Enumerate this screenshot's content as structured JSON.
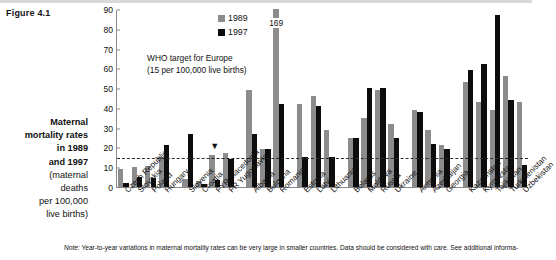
{
  "figure": {
    "label": "Figure 4.1"
  },
  "side_caption": {
    "lines": [
      {
        "text": "Maternal",
        "bold": true
      },
      {
        "text": "mortality rates",
        "bold": true
      },
      {
        "text": "in 1989",
        "bold": true
      },
      {
        "text": "and 1997",
        "bold": true
      },
      {
        "text": "(maternal",
        "bold": false
      },
      {
        "text": "deaths",
        "bold": false
      },
      {
        "text": "per 100,000",
        "bold": false
      },
      {
        "text": "live births)",
        "bold": false
      }
    ]
  },
  "legend": {
    "items": [
      {
        "label": "1989",
        "color": "#8c8c8c"
      },
      {
        "label": "1997",
        "color": "#0d0d0d"
      }
    ]
  },
  "annotations": {
    "who_target_line1": "WHO target for Europe",
    "who_target_line2": "(15 per 100,000 live births)",
    "who_target_value": 15,
    "romania_1989_label": "169",
    "caret_glyph": "▼"
  },
  "footnote": {
    "prefix": "Note:",
    "text": " Year-to-year variations in maternal mortality rates can be very large in smaller countries. Data should be considered with care. See additional informa-"
  },
  "chart_data": {
    "type": "bar",
    "xlabel": "",
    "ylabel": "maternal deaths per 100,000 live births",
    "ylim": [
      0,
      90
    ],
    "yticks": [
      0,
      10,
      20,
      30,
      40,
      50,
      60,
      70,
      80,
      90
    ],
    "grid": false,
    "legend_position": "top-left-inside",
    "reference_line": {
      "label": "WHO target for Europe",
      "value": 15,
      "style": "dashed"
    },
    "categories": [
      "Czech Republic",
      "Slovakia",
      "Poland",
      "Hungary",
      "Slovenia",
      "Croatia",
      "FYR Macedonia",
      "FR Yugoslavia",
      "Albania",
      "Bulgaria",
      "Romania",
      "Estonia",
      "Latvia",
      "Lithuania",
      "Belarus",
      "Moldova",
      "Russia",
      "Ukraine",
      "Armenia",
      "Azerbaijan",
      "Georgia",
      "Kazakhstan",
      "Kyrgyzstan",
      "Tajikistan",
      "Turkmenistan",
      "Uzbekistan"
    ],
    "group_breaks_after": [
      "Hungary",
      "FR Yugoslavia",
      "Romania",
      "Lithuania",
      "Ukraine",
      "Georgia"
    ],
    "series": [
      {
        "name": "1989",
        "color": "#8c8c8c",
        "values": [
          9,
          10,
          10.5,
          15,
          4,
          3,
          16,
          17,
          49,
          19,
          169,
          42,
          46,
          29,
          25,
          35,
          49,
          32,
          39,
          29,
          21,
          53,
          43,
          39,
          56,
          43
        ]
      },
      {
        "name": "1997",
        "color": "#0d0d0d",
        "values": [
          2,
          5,
          4.5,
          21,
          27,
          1.5,
          3.5,
          14,
          27,
          19,
          42,
          15,
          41,
          15,
          25,
          50,
          50,
          25,
          38,
          22,
          19,
          59,
          62,
          87,
          44,
          11
        ]
      }
    ],
    "clipped_points": [
      {
        "category": "Romania",
        "series": "1989",
        "value": 169,
        "display_label": "169"
      }
    ]
  }
}
